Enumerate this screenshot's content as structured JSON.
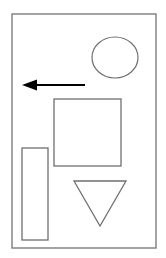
{
  "figure": {
    "background_color": "#ffffff",
    "canvas": {
      "width": 166,
      "height": 258
    },
    "frame": {
      "label": "outer frame",
      "x": 12,
      "y": 14,
      "width": 144,
      "height": 234,
      "stroke_color": "#7d7d7d",
      "stroke_width": 1.4,
      "fill": "none"
    },
    "shapes": [
      {
        "name": "ellipse",
        "label": "Ellipse",
        "cx": 115,
        "cy": 57.5,
        "rx": 23,
        "ry": 20.5,
        "stroke_color": "#6f6f6f",
        "stroke_width": 1.2,
        "fill": "none"
      },
      {
        "name": "arrow",
        "label": "Left-pointing arrow",
        "direction": "left",
        "tip_x": 22,
        "tip_y": 85,
        "tail_x": 85,
        "tail_y": 85,
        "head_length": 15,
        "head_half_height": 5.5,
        "shaft_thickness": 2.2,
        "color": "#000000"
      },
      {
        "name": "square",
        "label": "Square",
        "x": 54,
        "y": 99,
        "width": 67,
        "height": 67,
        "stroke_color": "#6f6f6f",
        "stroke_width": 1.3,
        "fill": "none"
      },
      {
        "name": "vertical-rectangle",
        "label": "Vertical rectangle",
        "x": 22,
        "y": 148,
        "width": 26,
        "height": 92,
        "stroke_color": "#6f6f6f",
        "stroke_width": 1.3,
        "fill": "none"
      },
      {
        "name": "triangle",
        "label": "Inverted triangle",
        "orientation": "pointing-down",
        "points": "74,181 126,181 100,226",
        "stroke_color": "#6f6f6f",
        "stroke_width": 1.3,
        "fill": "none"
      }
    ]
  }
}
